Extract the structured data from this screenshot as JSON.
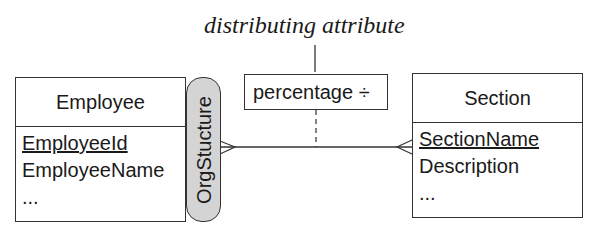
{
  "diagram": {
    "annotation": "distributing attribute",
    "entities": [
      {
        "name": "Employee",
        "attributes": [
          {
            "label": "EmployeeId",
            "key": true
          },
          {
            "label": "EmployeeName",
            "key": false
          },
          {
            "label": "...",
            "key": false
          }
        ]
      },
      {
        "name": "Section",
        "attributes": [
          {
            "label": "SectionName",
            "key": true
          },
          {
            "label": "Description",
            "key": false
          },
          {
            "label": "...",
            "key": false
          }
        ]
      }
    ],
    "relationship": {
      "name": "OrgStucture",
      "fill_color": "#d4d4d4"
    },
    "relationship_attribute": "percentage ÷"
  }
}
